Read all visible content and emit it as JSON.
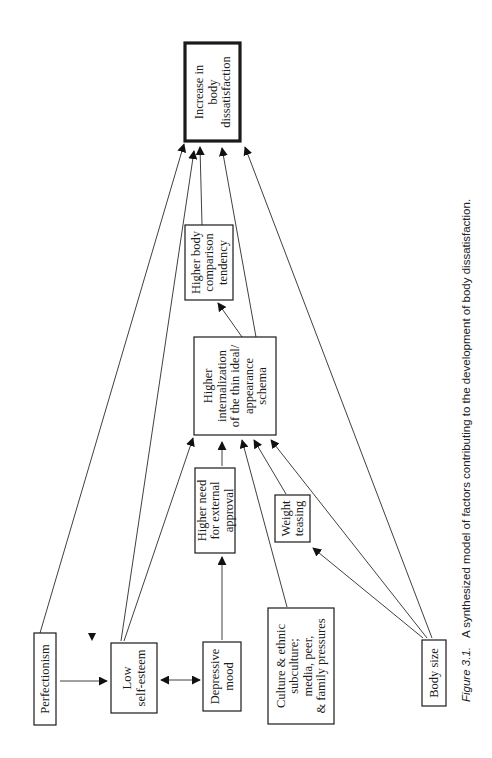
{
  "figure": {
    "orientation": "rotated-90-ccw",
    "caption_label": "Figure 3.1.",
    "caption_text": "A synthesized model of factors contributing to the development of body dissatisfaction."
  },
  "nodes": [
    {
      "id": "increase",
      "lines": [
        "Increase in",
        "body",
        "dissatisfaction"
      ],
      "emphasis": true
    },
    {
      "id": "comparison",
      "lines": [
        "Higher body",
        "comparison",
        "tendency"
      ]
    },
    {
      "id": "internalization",
      "lines": [
        "Higher",
        "internalization",
        "of the thin ideal/",
        "appearance",
        "schema"
      ]
    },
    {
      "id": "approval",
      "lines": [
        "Higher need",
        "for external",
        "approval"
      ]
    },
    {
      "id": "teasing",
      "lines": [
        "Weight",
        "teasing"
      ]
    },
    {
      "id": "perfectionism",
      "lines": [
        "Perfectionism"
      ]
    },
    {
      "id": "selfesteem",
      "lines": [
        "Low",
        "self-esteem"
      ]
    },
    {
      "id": "depressive",
      "lines": [
        "Depressive",
        "mood"
      ]
    },
    {
      "id": "culture",
      "lines": [
        "Culture & ethnic",
        "subculture;",
        "media, peer,",
        "& family pressures"
      ]
    },
    {
      "id": "bodysize",
      "lines": [
        "Body size"
      ]
    }
  ],
  "edges": [
    {
      "from": "perfectionism",
      "to": "increase"
    },
    {
      "from": "perfectionism",
      "to": "selfesteem"
    },
    {
      "from": "selfesteem",
      "to": "depressive",
      "bidirectional": true
    },
    {
      "from": "selfesteem",
      "to": "increase"
    },
    {
      "from": "selfesteem",
      "to": "internalization"
    },
    {
      "from": "depressive",
      "to": "approval"
    },
    {
      "from": "approval",
      "to": "internalization"
    },
    {
      "from": "culture",
      "to": "internalization"
    },
    {
      "from": "teasing",
      "to": "internalization"
    },
    {
      "from": "bodysize",
      "to": "teasing"
    },
    {
      "from": "bodysize",
      "to": "internalization"
    },
    {
      "from": "bodysize",
      "to": "increase"
    },
    {
      "from": "internalization",
      "to": "comparison"
    },
    {
      "from": "internalization",
      "to": "increase"
    },
    {
      "from": "comparison",
      "to": "increase"
    }
  ]
}
